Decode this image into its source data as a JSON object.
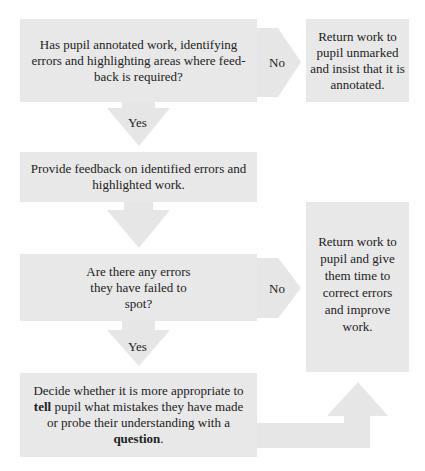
{
  "diagram": {
    "type": "flowchart",
    "colors": {
      "box_fill": "#e8e8e8",
      "arrow_fill": "#e6e6e6",
      "text": "#222222",
      "background": "#ffffff"
    },
    "nodes": [
      {
        "id": "q1",
        "kind": "decision",
        "text": "Has pupil annotated work, identifying errors and highlighting areas where feed-back is required?"
      },
      {
        "id": "r1",
        "kind": "action",
        "text": "Return work to pupil unmarked and insist that it is annotated."
      },
      {
        "id": "a1",
        "kind": "action",
        "text": "Provide feedback on identified errors and highlighted work."
      },
      {
        "id": "q2",
        "kind": "decision",
        "text": "Are there any errors they have failed to spot?"
      },
      {
        "id": "r2",
        "kind": "action",
        "text": "Return work to pupil and give them time to correct errors and improve work."
      },
      {
        "id": "a2",
        "kind": "action",
        "text_before_bold1": "Decide whether it is more appropriate to ",
        "bold1": "tell",
        "text_between": " pupil what mistakes they have made or probe their understanding with a ",
        "bold2": "question",
        "text_after": "."
      }
    ],
    "edges": [
      {
        "from": "q1",
        "to": "r1",
        "label": "No"
      },
      {
        "from": "q1",
        "to": "a1",
        "label": "Yes"
      },
      {
        "from": "a1",
        "to": "q2",
        "label": ""
      },
      {
        "from": "q2",
        "to": "r2",
        "label": "No"
      },
      {
        "from": "q2",
        "to": "a2",
        "label": "Yes"
      },
      {
        "from": "a2",
        "to": "r2",
        "label": ""
      }
    ]
  }
}
